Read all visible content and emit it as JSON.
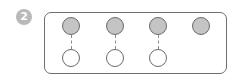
{
  "diagram": {
    "step_badge": {
      "label": "2",
      "color": "#b9b9b9"
    },
    "frame": {
      "border_color": "#6e6e6e"
    },
    "colors": {
      "filled_node": "#c4c4c4",
      "empty_node": "#ffffff",
      "node_outline": "#6a6a6a",
      "link": "#8a8a8a"
    },
    "columns": [
      {
        "top": "filled",
        "bottom": "empty",
        "linked": true
      },
      {
        "top": "filled",
        "bottom": "empty",
        "linked": true
      },
      {
        "top": "filled",
        "bottom": "empty",
        "linked": true
      },
      {
        "top": "filled",
        "bottom": null,
        "linked": false
      }
    ]
  }
}
